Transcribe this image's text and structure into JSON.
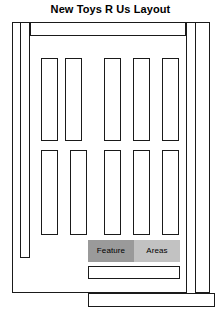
{
  "page": {
    "title": "New Toys R Us Layout",
    "colors": {
      "stroke": "#1a1a1a",
      "background": "#ffffff",
      "legend_dark": "#9a9a9a",
      "legend_light": "#c2c2c2"
    }
  },
  "floorplan": {
    "name": "store-floorplan",
    "outer_wall": {
      "label": "store-perimeter-wall"
    },
    "aisles": [
      {
        "name": "left-perimeter-aisle",
        "label": ""
      },
      {
        "name": "right-perimeter-aisle",
        "label": ""
      },
      {
        "name": "top-horizontal-aisle",
        "label": ""
      }
    ],
    "shelf_rows": [
      {
        "name": "upper-shelf-row",
        "count": 5,
        "shelves": [
          {
            "label": ""
          },
          {
            "label": ""
          },
          {
            "label": ""
          },
          {
            "label": ""
          },
          {
            "label": ""
          }
        ]
      },
      {
        "name": "lower-shelf-row",
        "count": 5,
        "shelves": [
          {
            "label": ""
          },
          {
            "label": ""
          },
          {
            "label": ""
          },
          {
            "label": ""
          },
          {
            "label": ""
          }
        ]
      }
    ],
    "checkout_bars": [
      {
        "name": "upper-checkout-counter",
        "label": ""
      },
      {
        "name": "lower-checkout-counter",
        "label": ""
      }
    ]
  },
  "legend": {
    "name": "feature-areas-legend",
    "cells": [
      {
        "label": "Feature",
        "shade": "dark"
      },
      {
        "label": "Areas",
        "shade": "light"
      }
    ]
  }
}
